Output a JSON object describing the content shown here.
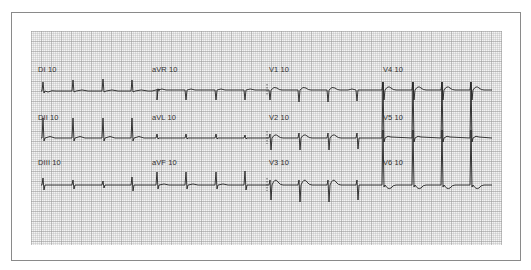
{
  "ecg": {
    "layout": "3x4 standard 12-lead",
    "trace_color": "#222222",
    "grid_color": "#c8c8c8",
    "leads": [
      {
        "id": "I",
        "label": "DI 10",
        "row": 0,
        "col": 0
      },
      {
        "id": "II",
        "label": "DII 10",
        "row": 1,
        "col": 0
      },
      {
        "id": "III",
        "label": "DIII 10",
        "row": 2,
        "col": 0
      },
      {
        "id": "aVR",
        "label": "aVR 10",
        "row": 0,
        "col": 1
      },
      {
        "id": "aVL",
        "label": "aVL 10",
        "row": 1,
        "col": 1
      },
      {
        "id": "aVF",
        "label": "aVF 10",
        "row": 2,
        "col": 1
      },
      {
        "id": "V1",
        "label": "V1 10",
        "row": 0,
        "col": 2
      },
      {
        "id": "V2",
        "label": "V2 10",
        "row": 1,
        "col": 2
      },
      {
        "id": "V3",
        "label": "V3 10",
        "row": 2,
        "col": 2
      },
      {
        "id": "V4",
        "label": "V4 10",
        "row": 0,
        "col": 3
      },
      {
        "id": "V5",
        "label": "V5 10",
        "row": 1,
        "col": 3
      },
      {
        "id": "V6",
        "label": "V6 10",
        "row": 2,
        "col": 3
      }
    ]
  },
  "labels": {
    "DI": "DI 10",
    "DII": "DII 10",
    "DIII": "DIII 10",
    "aVR": "aVR 10",
    "aVL": "aVL 10",
    "aVF": "aVF 10",
    "V1": "V1 10",
    "V2": "V2 10",
    "V3": "V3 10",
    "V4": "V4 10",
    "V5": "V5 10",
    "V6": "V6 10"
  }
}
